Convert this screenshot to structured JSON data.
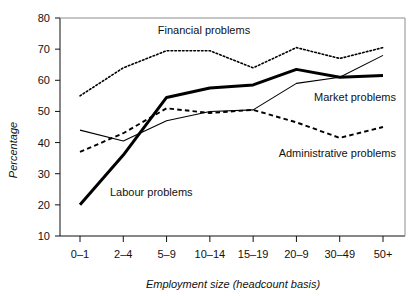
{
  "chart_data": {
    "type": "line",
    "title": "",
    "xlabel": "Employment size (headcount basis)",
    "ylabel": "Percentage",
    "categories": [
      "0–1",
      "2–4",
      "5–9",
      "10–14",
      "15–19",
      "20–9",
      "30–49",
      "50+"
    ],
    "yticks": [
      10,
      20,
      30,
      40,
      50,
      60,
      70,
      80
    ],
    "ylim": [
      10,
      80
    ],
    "grid": false,
    "legend": "inline-annotations",
    "series": [
      {
        "name": "Financial problems",
        "style": "dotted",
        "values": [
          55,
          64,
          69.5,
          69.5,
          64,
          70.5,
          67,
          70.5
        ]
      },
      {
        "name": "Labour problems",
        "style": "thick-solid",
        "values": [
          20,
          36,
          54.5,
          57.5,
          58.5,
          63.5,
          61,
          61.5
        ]
      },
      {
        "name": "Market problems",
        "style": "thin-solid",
        "values": [
          44,
          40.5,
          47,
          50,
          50.5,
          59,
          61,
          68
        ]
      },
      {
        "name": "Administrative problems",
        "style": "dashed",
        "values": [
          37,
          43,
          51,
          49.5,
          50.5,
          46.5,
          41.5,
          45
        ]
      }
    ],
    "annotations": [
      {
        "text": "Financial problems",
        "x_px": 204,
        "y_px": 34,
        "anchor": "middle"
      },
      {
        "text": "Market problems",
        "x_px": 396,
        "y_px": 101,
        "anchor": "end"
      },
      {
        "text": "Administrative problems",
        "x_px": 396,
        "y_px": 157,
        "anchor": "end"
      },
      {
        "text": "Labour problems",
        "x_px": 110,
        "y_px": 196,
        "anchor": "start"
      }
    ]
  }
}
